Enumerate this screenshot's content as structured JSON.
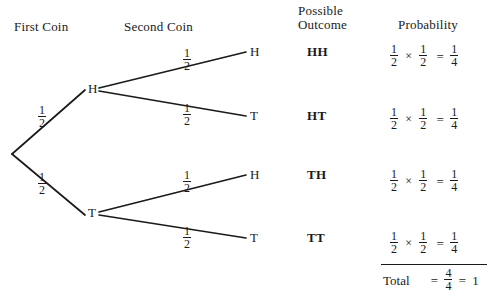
{
  "headers": {
    "first_coin": "First Coin",
    "second_coin": "Second Coin",
    "possible_line1": "Possible",
    "possible_line2": "Outcome",
    "probability": "Probability"
  },
  "tree": {
    "level1": [
      {
        "label": "H",
        "prob_num": "1",
        "prob_den": "2"
      },
      {
        "label": "T",
        "prob_num": "1",
        "prob_den": "2"
      }
    ],
    "level2": [
      {
        "label": "H",
        "prob_num": "1",
        "prob_den": "2"
      },
      {
        "label": "T",
        "prob_num": "1",
        "prob_den": "2"
      },
      {
        "label": "H",
        "prob_num": "1",
        "prob_den": "2"
      },
      {
        "label": "T",
        "prob_num": "1",
        "prob_den": "2"
      }
    ]
  },
  "outcomes": [
    "HH",
    "HT",
    "TH",
    "TT"
  ],
  "probabilities": [
    {
      "a_num": "1",
      "a_den": "2",
      "op": "×",
      "b_num": "1",
      "b_den": "2",
      "eq": "=",
      "r_num": "1",
      "r_den": "4"
    },
    {
      "a_num": "1",
      "a_den": "2",
      "op": "×",
      "b_num": "1",
      "b_den": "2",
      "eq": "=",
      "r_num": "1",
      "r_den": "4"
    },
    {
      "a_num": "1",
      "a_den": "2",
      "op": "×",
      "b_num": "1",
      "b_den": "2",
      "eq": "=",
      "r_num": "1",
      "r_den": "4"
    },
    {
      "a_num": "1",
      "a_den": "2",
      "op": "×",
      "b_num": "1",
      "b_den": "2",
      "eq": "=",
      "r_num": "1",
      "r_den": "4"
    }
  ],
  "total": {
    "label": "Total",
    "eq1": "=",
    "num": "4",
    "den": "4",
    "eq2": "=",
    "value": "1"
  },
  "colors": {
    "ink": "#1a1a1a",
    "background": "#ffffff"
  }
}
